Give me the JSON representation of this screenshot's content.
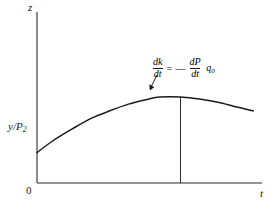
{
  "figure": {
    "type": "line",
    "background": "#ffffff",
    "ink_color": "#1a1a1a"
  },
  "axes": {
    "y_axis_label": "z",
    "x_axis_label": "t",
    "origin_label": "0",
    "y_intercept_label_main": "y/P",
    "y_intercept_label_sub": "2"
  },
  "annotation": {
    "dk_num": "dk",
    "dk_den": "dt",
    "equals": "=",
    "minus": "—",
    "dP_num": "dP",
    "dP_den": "dt",
    "q_symbol": "q",
    "q_sub": "0",
    "arrow_name": "annotation-arrow"
  },
  "chart_data": {
    "type": "line",
    "title": "",
    "xlabel": "t",
    "ylabel": "z",
    "grid": false,
    "legend": null,
    "xlim": [
      0,
      1
    ],
    "ylim": [
      0,
      1
    ],
    "annotations": [
      {
        "text": "dk/dt = - dP/dt q0",
        "points_to": "curve-maximum",
        "x": 0.68,
        "y": 0.99
      },
      {
        "text": "y/P2",
        "points_to": "y-intercept",
        "x": 0.0,
        "y": 0.32
      },
      {
        "text": "0",
        "points_to": "origin",
        "x": 0.0,
        "y": 0.0
      }
    ],
    "series": [
      {
        "name": "z(t)",
        "description": "concave curve rising from y/P2 intercept to a maximum then declining",
        "x": [
          0.0,
          0.08,
          0.17,
          0.26,
          0.35,
          0.44,
          0.53,
          0.59,
          0.69,
          0.78,
          0.87,
          0.96,
          1.04
        ],
        "y": [
          0.32,
          0.45,
          0.57,
          0.68,
          0.76,
          0.83,
          0.88,
          0.905,
          0.905,
          0.885,
          0.85,
          0.8,
          0.76
        ]
      }
    ],
    "vertical_marker": {
      "name": "drop-line-at-maximum",
      "x": 0.69,
      "y_from": 0.0,
      "y_to": 0.905
    }
  }
}
